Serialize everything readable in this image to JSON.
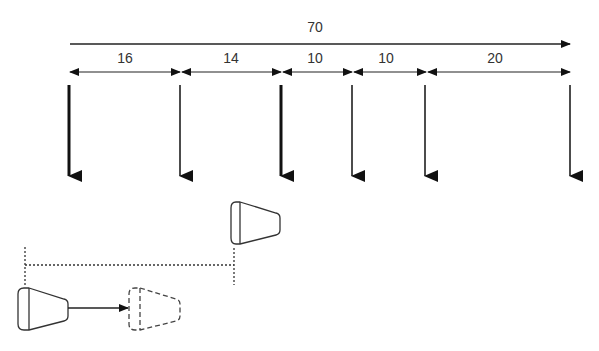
{
  "total": {
    "label": "70",
    "x": 315,
    "y": 19
  },
  "segments": [
    {
      "label": "16",
      "x": 125,
      "y": 50
    },
    {
      "label": "14",
      "x": 231,
      "y": 50
    },
    {
      "label": "10",
      "x": 315,
      "y": 50
    },
    {
      "label": "10",
      "x": 386,
      "y": 50
    },
    {
      "label": "20",
      "x": 495,
      "y": 50
    }
  ],
  "colors": {
    "line": "#222222",
    "text": "#333333"
  }
}
